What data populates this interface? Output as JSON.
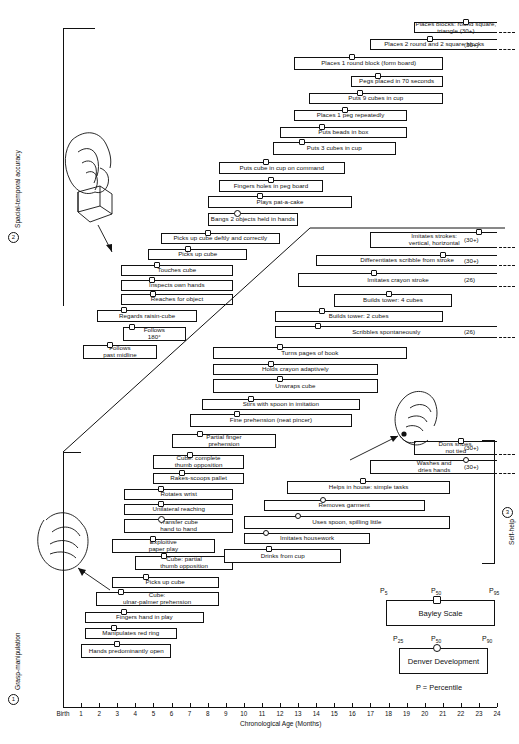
{
  "chart_data": {
    "type": "bar",
    "title": "",
    "xlabel": "Chronological Age (Months)",
    "xlim": [
      0,
      24
    ],
    "xticks": [
      "Birth",
      "1",
      "2",
      "3",
      "4",
      "5",
      "6",
      "7",
      "8",
      "9",
      "10",
      "11",
      "12",
      "13",
      "14",
      "15",
      "16",
      "17",
      "18",
      "19",
      "20",
      "21",
      "22",
      "23",
      "24"
    ],
    "grid": false,
    "sections": [
      {
        "num": "2",
        "label": "Spacial-temporal accuracy"
      },
      {
        "num": "1",
        "label": "Grasp-manipulation"
      },
      {
        "num": "3",
        "label": "Self-help"
      }
    ],
    "bars": [
      {
        "label": "Places blocks: round square, triangle (30+)",
        "start": 19.4,
        "end": 24.0,
        "marker": 22.3,
        "marker_type": "sq",
        "open_end": true,
        "annot": ""
      },
      {
        "label": "Places 2 round and 2 square blocks",
        "start": 17.0,
        "end": 24.0,
        "marker": 20.3,
        "marker_type": "sq",
        "open_end": true,
        "annot": "(30+)"
      },
      {
        "label": "Places 1 round block (form board)",
        "start": 12.8,
        "end": 21.0,
        "marker": 16.0,
        "marker_type": "sq",
        "open_end": false,
        "annot": ""
      },
      {
        "label": "Pegs placed in 70 seconds",
        "start": 15.9,
        "end": 21.0,
        "marker": 17.4,
        "marker_type": "sq",
        "open_end": false,
        "annot": ""
      },
      {
        "label": "Puts 9 cubes in cup",
        "start": 13.6,
        "end": 21.0,
        "marker": 16.4,
        "marker_type": "sq",
        "open_end": false,
        "annot": ""
      },
      {
        "label": "Places 1 peg repeatedly",
        "start": 12.8,
        "end": 19.0,
        "marker": 15.6,
        "marker_type": "sq",
        "open_end": false,
        "annot": ""
      },
      {
        "label": "Puts beads in box",
        "start": 12.0,
        "end": 19.0,
        "marker": 14.3,
        "marker_type": "sq",
        "open_end": false,
        "annot": ""
      },
      {
        "label": "Puts 3 cubes in cup",
        "start": 11.6,
        "end": 18.4,
        "marker": 13.2,
        "marker_type": "sq",
        "open_end": false,
        "annot": ""
      },
      {
        "label": "Puts cube in cup on command",
        "start": 8.6,
        "end": 15.6,
        "marker": 11.2,
        "marker_type": "sq",
        "open_end": false,
        "annot": ""
      },
      {
        "label": "Fingers holes in peg board",
        "start": 8.6,
        "end": 14.4,
        "marker": 11.5,
        "marker_type": "sq",
        "open_end": false,
        "annot": ""
      },
      {
        "label": "Plays pat-a-cake",
        "start": 8.0,
        "end": 16.0,
        "marker": 10.9,
        "marker_type": "sq",
        "open_end": false,
        "annot": ""
      },
      {
        "label": "Bangs 2 objects held in hands",
        "start": 8.0,
        "end": 13.0,
        "marker": 9.6,
        "marker_type": "ci",
        "marker_bold": true,
        "open_end": false,
        "annot": ""
      },
      {
        "label": "Picks up cube deftly and correctly",
        "start": 5.4,
        "end": 12.0,
        "marker": 8.0,
        "marker_type": "sq",
        "open_end": false,
        "annot": ""
      },
      {
        "label": "Picks up cube",
        "start": 4.7,
        "end": 10.2,
        "marker": 6.9,
        "marker_type": "sq",
        "open_end": false,
        "annot": ""
      },
      {
        "label": "Touches cube",
        "start": 3.2,
        "end": 9.4,
        "marker": 5.2,
        "marker_type": "sq",
        "open_end": false,
        "annot": ""
      },
      {
        "label": "Inspects own hands",
        "start": 3.2,
        "end": 9.4,
        "marker": 4.9,
        "marker_type": "sq",
        "open_end": false,
        "annot": ""
      },
      {
        "label": "Reaches for object",
        "start": 3.2,
        "end": 9.4,
        "marker": 5.0,
        "marker_type": "sq",
        "open_end": false,
        "annot": ""
      },
      {
        "label": "Regards raisin-cube",
        "start": 1.9,
        "end": 7.4,
        "marker": 3.4,
        "marker_type": "sq",
        "open_end": false,
        "annot": ""
      },
      {
        "label": "Follows\n180°",
        "start": 3.3,
        "end": 6.8,
        "marker": 3.8,
        "marker_type": "sq",
        "open_end": false,
        "annot": ""
      },
      {
        "label": "Follows\npast midline",
        "start": 1.1,
        "end": 5.2,
        "marker": 2.6,
        "marker_type": "sq",
        "open_end": false,
        "annot": ""
      },
      {
        "label": "Imitates strokes:\nvertical, horizontal",
        "start": 17.0,
        "end": 24.0,
        "marker": 23.0,
        "marker_type": "sq",
        "open_end": true,
        "annot": "(30+)"
      },
      {
        "label": "Differentiates scribble from stroke",
        "start": 14.0,
        "end": 24.0,
        "marker": 21.0,
        "marker_type": "sq",
        "open_end": true,
        "annot": "(30+)"
      },
      {
        "label": "Imitates crayon stroke",
        "start": 13.0,
        "end": 24.0,
        "marker": 17.2,
        "marker_type": "sq",
        "open_end": true,
        "annot": "(26)"
      },
      {
        "label": "Builds tower: 4 cubes",
        "start": 15.0,
        "end": 21.5,
        "marker": 18.0,
        "marker_type": "sq",
        "open_end": false,
        "annot": ""
      },
      {
        "label": "Builds tower: 2 cubes",
        "start": 11.7,
        "end": 21.0,
        "marker": 14.3,
        "marker_type": "sq",
        "open_end": false,
        "annot": ""
      },
      {
        "label": "Scribbles spontaneously",
        "start": 11.7,
        "end": 24.0,
        "marker": 14.1,
        "marker_type": "sq",
        "open_end": true,
        "annot": "(26)"
      },
      {
        "label": "Turns pages of book",
        "start": 8.3,
        "end": 19.0,
        "marker": 12.0,
        "marker_type": "sq",
        "open_end": false,
        "annot": ""
      },
      {
        "label": "Holds crayon adaptively",
        "start": 8.3,
        "end": 17.4,
        "marker": 11.5,
        "marker_type": "sq",
        "open_end": false,
        "annot": ""
      },
      {
        "label": "Unwraps cube",
        "start": 8.3,
        "end": 17.4,
        "marker": 12.0,
        "marker_type": "sq",
        "open_end": false,
        "annot": ""
      },
      {
        "label": "Stirs with spoon in imitation",
        "start": 7.7,
        "end": 16.4,
        "marker": 10.4,
        "marker_type": "sq",
        "open_end": false,
        "annot": ""
      },
      {
        "label": "Fine prehension (neat pincer)",
        "start": 7.0,
        "end": 16.0,
        "marker": 9.6,
        "marker_type": "sq",
        "open_end": false,
        "annot": ""
      },
      {
        "label": "Partial finger\nprehension",
        "start": 6.0,
        "end": 11.8,
        "marker": 7.6,
        "marker_type": "sq",
        "open_end": false,
        "annot": ""
      },
      {
        "label": "Cube: complete\nthumb opposition",
        "start": 5.0,
        "end": 10.0,
        "marker": 7.0,
        "marker_type": "sq",
        "open_end": false,
        "annot": ""
      },
      {
        "label": "Rakes-scoops pallet",
        "start": 5.0,
        "end": 10.0,
        "marker": 6.6,
        "marker_type": "sq",
        "open_end": false,
        "annot": ""
      },
      {
        "label": "Rotates wrist",
        "start": 3.4,
        "end": 9.4,
        "marker": 5.4,
        "marker_type": "sq",
        "open_end": false,
        "annot": ""
      },
      {
        "label": "Unilateral reaching",
        "start": 3.4,
        "end": 9.4,
        "marker": 5.4,
        "marker_type": "sq",
        "open_end": false,
        "annot": ""
      },
      {
        "label": "Transfer cube\nhand to hand",
        "start": 3.4,
        "end": 9.4,
        "marker": 5.4,
        "marker_type": "ci",
        "marker_bold": true,
        "open_end": false,
        "annot": ""
      },
      {
        "label": "Exploitive\npaper play",
        "start": 2.7,
        "end": 8.4,
        "marker": 5.0,
        "marker_type": "sq",
        "open_end": false,
        "annot": ""
      },
      {
        "label": "Cube: partial\nthumb opposition",
        "start": 4.0,
        "end": 9.4,
        "marker": 5.6,
        "marker_type": "sq",
        "open_end": false,
        "annot": ""
      },
      {
        "label": "Picks up cube",
        "start": 2.7,
        "end": 8.6,
        "marker": 4.6,
        "marker_type": "sq",
        "open_end": false,
        "annot": ""
      },
      {
        "label": "Cube:\nulnar-palmer prehension",
        "start": 1.8,
        "end": 8.6,
        "marker": 3.2,
        "marker_type": "sq",
        "open_end": false,
        "annot": ""
      },
      {
        "label": "Fingers hand in play",
        "start": 1.2,
        "end": 7.8,
        "marker": 3.4,
        "marker_type": "sq",
        "open_end": false,
        "annot": ""
      },
      {
        "label": "Manipulates red ring",
        "start": 1.2,
        "end": 6.3,
        "marker": 2.8,
        "marker_type": "sq",
        "open_end": false,
        "annot": ""
      },
      {
        "label": "Hands predominantly open",
        "start": 1.0,
        "end": 6.0,
        "marker": 3.0,
        "marker_type": "sq",
        "open_end": false,
        "annot": ""
      },
      {
        "label": "Dons shoes,\nnot tied",
        "start": 19.4,
        "end": 24.0,
        "marker": 22.0,
        "marker_type": "sq",
        "open_end": true,
        "annot": "(30+)"
      },
      {
        "label": "Washes and\ndries hands",
        "start": 17.0,
        "end": 24.0,
        "marker": 22.3,
        "marker_type": "ci",
        "open_end": true,
        "annot": "(30+)"
      },
      {
        "label": "Helps in house: simple tasks",
        "start": 12.4,
        "end": 21.4,
        "marker": 16.6,
        "marker_type": "sq",
        "open_end": false,
        "annot": ""
      },
      {
        "label": "Removes garment",
        "start": 11.1,
        "end": 20.0,
        "marker": 14.4,
        "marker_type": "ci",
        "open_end": false,
        "annot": ""
      },
      {
        "label": "Uses spoon, spilling little",
        "start": 10.0,
        "end": 21.4,
        "marker": 13.0,
        "marker_type": "ci",
        "open_end": false,
        "annot": ""
      },
      {
        "label": "Imitates housework",
        "start": 10.0,
        "end": 17.0,
        "marker": 11.2,
        "marker_type": "ci",
        "open_end": false,
        "annot": ""
      },
      {
        "label": "Drinks from cup",
        "start": 8.9,
        "end": 15.4,
        "marker": 11.4,
        "marker_type": "sq",
        "open_end": false,
        "annot": ""
      }
    ]
  },
  "legend": {
    "bayley": {
      "name": "Bayley Scale",
      "percentiles": [
        "P5",
        "P50",
        "P95"
      ],
      "p_sub": [
        "5",
        "50",
        "95"
      ],
      "marker_type": "square"
    },
    "denver": {
      "name": "Denver Development",
      "percentiles": [
        "P25",
        "P50",
        "P90"
      ],
      "p_sub": [
        "25",
        "50",
        "90"
      ],
      "marker_type": "circle"
    },
    "footnote": "P = Percentile"
  }
}
